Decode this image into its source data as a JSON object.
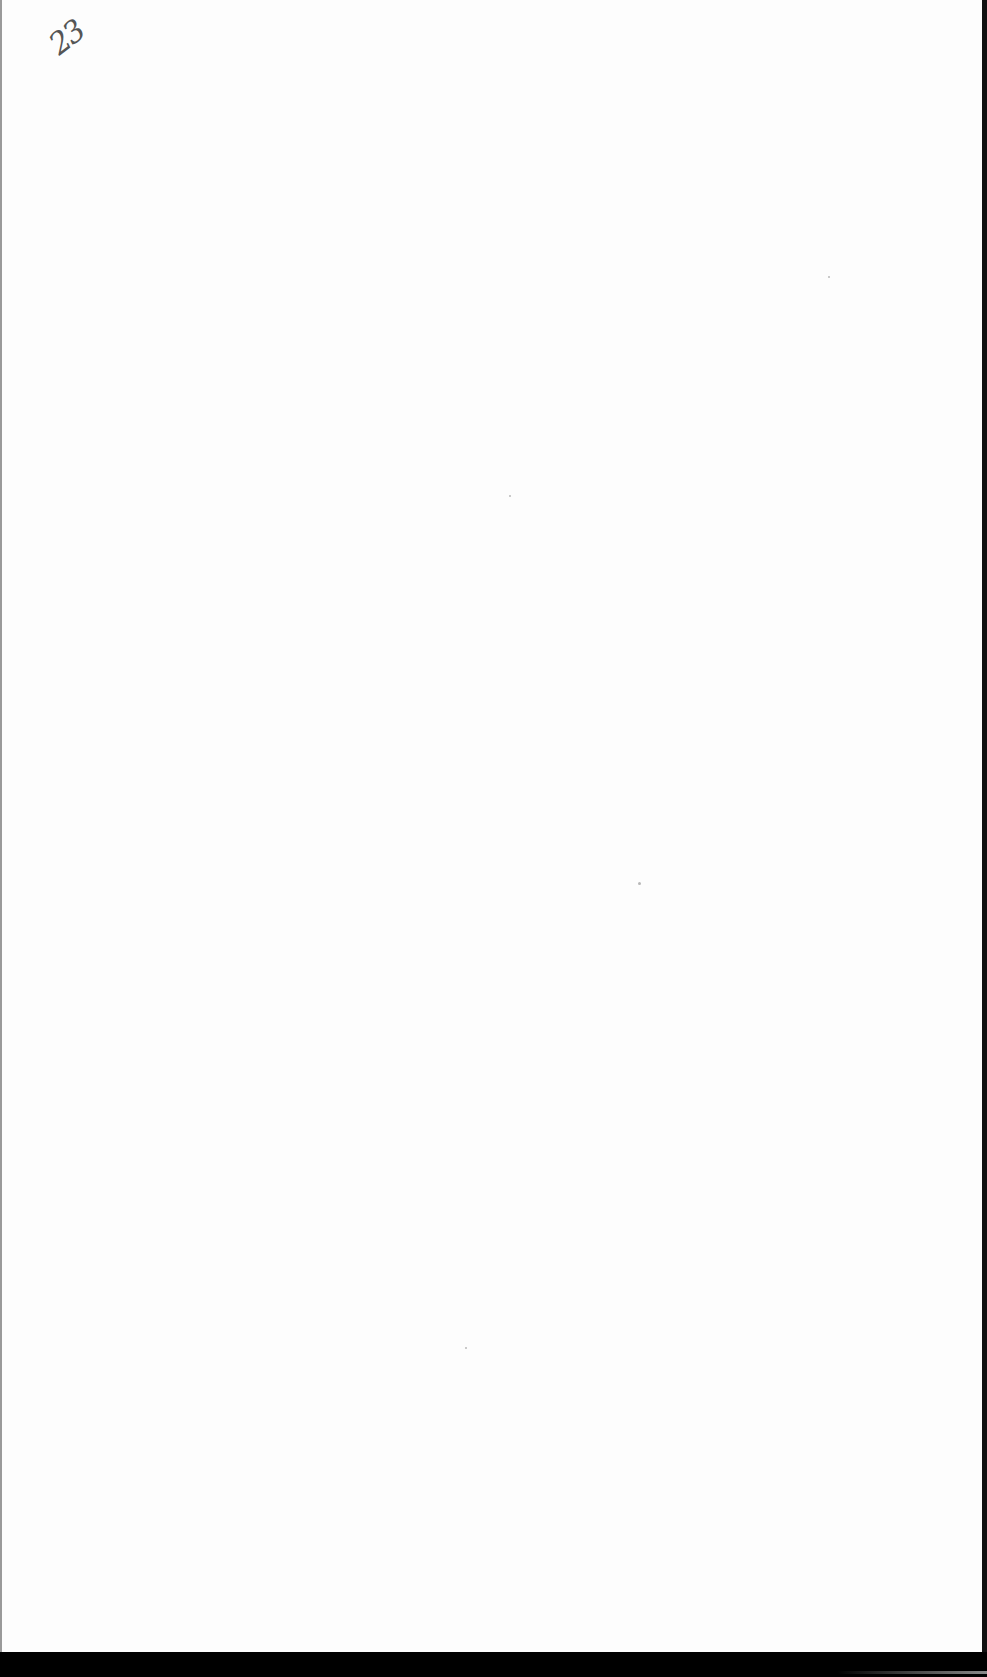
{
  "document": {
    "type": "scanned blank page",
    "handwritten_page_number": "23"
  },
  "colors": {
    "paper": "#fdfdfd",
    "ink": "#555555",
    "scan_border": "#000000"
  }
}
